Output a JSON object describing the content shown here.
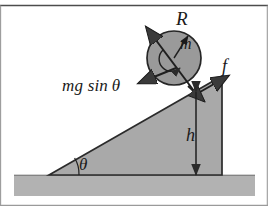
{
  "figure": {
    "background_color": "#ffffff",
    "border_line_color": "#555555",
    "incline_fill": "#a8a8a8",
    "ground_fill": "#b0b0b0",
    "disk_fill": "#999999",
    "stroke_color": "#1a1a1a"
  },
  "labels": {
    "radius": "R",
    "mass": "m",
    "friction": "f",
    "gravity_component": "mg sin",
    "gravity_component_angle": "θ",
    "height": "h",
    "incline_angle": "θ"
  },
  "geometry": {
    "disk": {
      "cx": 174,
      "cy": 58,
      "r": 27
    },
    "incline": {
      "base_left_x": 49,
      "base_y": 175,
      "apex_x": 222,
      "apex_y": 76,
      "right_x": 222
    },
    "ground": {
      "x": 14,
      "y": 175,
      "width": 241,
      "height": 21
    },
    "height_arrow": {
      "x": 196,
      "y_top": 92,
      "y_bottom": 175
    },
    "angle_arc_radius": 30
  },
  "vectors": [
    {
      "name": "normal-axis-arrow",
      "label": "R",
      "direction": "up-left along disk axis"
    },
    {
      "name": "mass-radius-arrow",
      "label": "m",
      "direction": "up-right from center"
    },
    {
      "name": "gravity-component-arrow",
      "label": "mg sin θ",
      "direction": "down-left along incline"
    },
    {
      "name": "friction-arrow",
      "label": "f",
      "direction": "up-right along incline"
    },
    {
      "name": "height-arrow",
      "label": "h",
      "direction": "vertical double-headed"
    },
    {
      "name": "rotation-arrow",
      "label": "",
      "direction": "clockwise spin at center"
    }
  ]
}
